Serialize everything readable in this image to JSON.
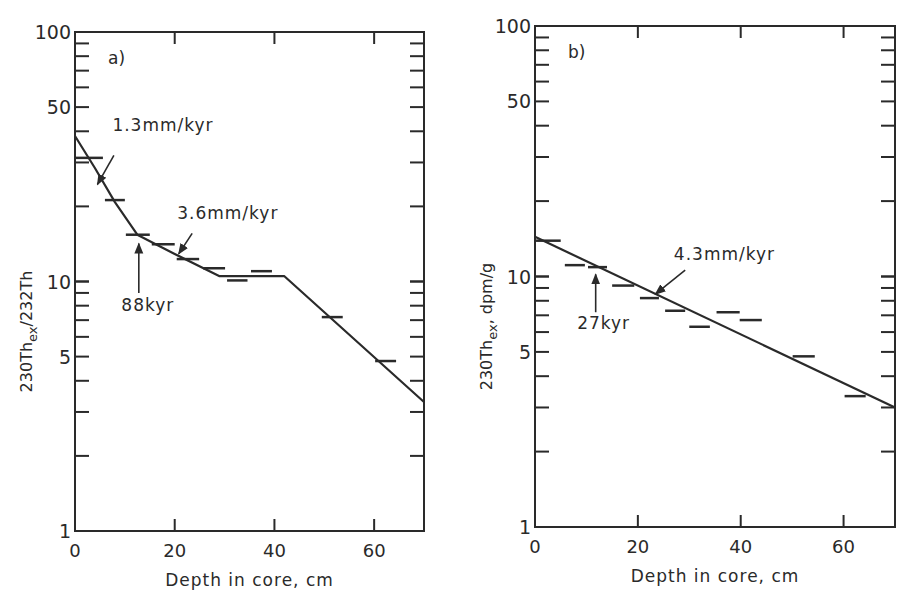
{
  "figure": {
    "background": "#ffffff",
    "ink_color": "#2a2a2a"
  },
  "chart_data": [
    {
      "type": "line",
      "panel_label": "a)",
      "title": "",
      "xlabel": "Depth in core, cm",
      "ylabel": {
        "main": "230Th",
        "sub": "ex",
        "rest": "/232Th"
      },
      "xlim": [
        0,
        70
      ],
      "ylim": [
        1,
        100
      ],
      "yscale": "log",
      "xticks": [
        0,
        20,
        40,
        60
      ],
      "yticks": [
        1,
        5,
        10,
        50,
        100
      ],
      "grid": false,
      "legend": null,
      "frame_px": {
        "left": 75,
        "right": 424,
        "top": 32,
        "bottom": 531
      },
      "series": [
        {
          "name": "measured (depth intervals)",
          "kind": "interval_markers",
          "intervals": [
            {
              "x0": 0.0,
              "x1": 5.6,
              "y": 31.3
            },
            {
              "x0": 6.0,
              "x1": 10.0,
              "y": 21.2
            },
            {
              "x0": 10.2,
              "x1": 15.0,
              "y": 15.4
            },
            {
              "x0": 15.4,
              "x1": 20.0,
              "y": 14.1
            },
            {
              "x0": 20.4,
              "x1": 24.9,
              "y": 12.3
            },
            {
              "x0": 25.7,
              "x1": 30.1,
              "y": 11.3
            },
            {
              "x0": 30.5,
              "x1": 34.6,
              "y": 10.1
            },
            {
              "x0": 35.3,
              "x1": 39.5,
              "y": 11.0
            },
            {
              "x0": 49.5,
              "x1": 53.7,
              "y": 7.2
            },
            {
              "x0": 60.2,
              "x1": 64.4,
              "y": 4.8
            }
          ]
        },
        {
          "name": "fitted decay",
          "kind": "line",
          "points": [
            {
              "x": 0,
              "y": 38.3
            },
            {
              "x": 4,
              "y": 28.5
            },
            {
              "x": 8,
              "y": 20.8
            },
            {
              "x": 12.5,
              "y": 15.4
            },
            {
              "x": 20,
              "y": 12.9
            },
            {
              "x": 29,
              "y": 10.5
            },
            {
              "x": 42,
              "y": 10.5
            },
            {
              "x": 70,
              "y": 3.29
            }
          ]
        }
      ],
      "annotations": [
        {
          "text": "1.3mm/kyr",
          "text_x": 7.5,
          "text_y": 40,
          "arrow_from": {
            "x": 7.8,
            "y": 32
          },
          "arrow_to": {
            "x": 4.5,
            "y": 24.5
          }
        },
        {
          "text": "3.6mm/kyr",
          "text_x": 20.5,
          "text_y": 17.8,
          "arrow_from": {
            "x": 23.5,
            "y": 15.6
          },
          "arrow_to": {
            "x": 20.8,
            "y": 12.9
          }
        },
        {
          "text": "88kyr",
          "text_x": 9.3,
          "text_y": 7.6,
          "arrow_from": {
            "x": 12.8,
            "y": 9.0
          },
          "arrow_to": {
            "x": 12.8,
            "y": 14.2
          }
        }
      ]
    },
    {
      "type": "line",
      "panel_label": "b)",
      "title": "",
      "xlabel": "Depth in core, cm",
      "ylabel": {
        "main": "230Th",
        "sub": "ex",
        "rest": ", dpm/g"
      },
      "xlim": [
        0,
        70
      ],
      "ylim": [
        1,
        100
      ],
      "yscale": "log",
      "xticks": [
        0,
        20,
        40,
        60
      ],
      "yticks": [
        1,
        5,
        10,
        50,
        100
      ],
      "grid": false,
      "legend": null,
      "frame_px": {
        "left": 535,
        "right": 895,
        "top": 26,
        "bottom": 527
      },
      "series": [
        {
          "name": "measured (depth intervals)",
          "kind": "interval_markers",
          "intervals": [
            {
              "x0": 0.2,
              "x1": 5.0,
              "y": 13.9
            },
            {
              "x0": 5.8,
              "x1": 9.7,
              "y": 11.1
            },
            {
              "x0": 10.3,
              "x1": 14.0,
              "y": 10.9
            },
            {
              "x0": 15.0,
              "x1": 19.3,
              "y": 9.2
            },
            {
              "x0": 20.4,
              "x1": 24.1,
              "y": 8.2
            },
            {
              "x0": 25.3,
              "x1": 29.2,
              "y": 7.3
            },
            {
              "x0": 30.0,
              "x1": 34.0,
              "y": 6.3
            },
            {
              "x0": 35.3,
              "x1": 39.8,
              "y": 7.2
            },
            {
              "x0": 39.8,
              "x1": 44.1,
              "y": 6.7
            },
            {
              "x0": 50.1,
              "x1": 54.4,
              "y": 4.8
            },
            {
              "x0": 60.2,
              "x1": 64.3,
              "y": 3.33
            }
          ]
        },
        {
          "name": "fitted decay",
          "kind": "line",
          "points": [
            {
              "x": 0,
              "y": 14.4
            },
            {
              "x": 70,
              "y": 3.0
            }
          ]
        }
      ],
      "annotations": [
        {
          "text": "4.3mm/kyr",
          "text_x": 27,
          "text_y": 11.6,
          "arrow_from": {
            "x": 29.2,
            "y": 10.6
          },
          "arrow_to": {
            "x": 23.4,
            "y": 8.5
          }
        },
        {
          "text": "27kyr",
          "text_x": 8.2,
          "text_y": 6.2,
          "arrow_from": {
            "x": 11.8,
            "y": 7.2
          },
          "arrow_to": {
            "x": 11.8,
            "y": 10.2
          }
        }
      ]
    }
  ]
}
